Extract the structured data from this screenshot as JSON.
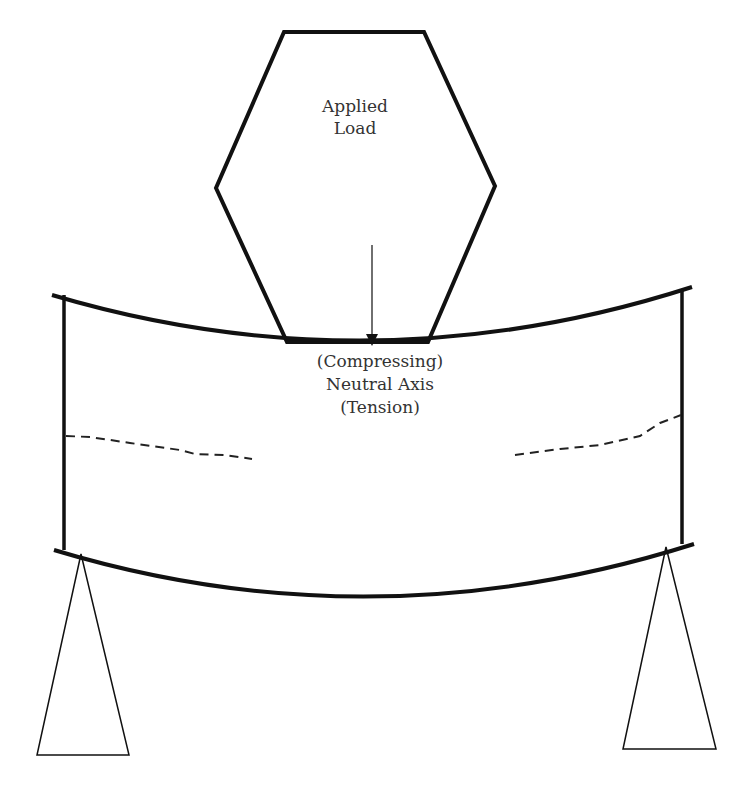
{
  "diagram": {
    "load_label": {
      "line1": "Applied",
      "line2": "Load"
    },
    "axis_labels": {
      "compressing": "(Compressing)",
      "neutral_axis": "Neutral Axis",
      "tension": "(Tension)"
    },
    "elements": [
      "applied-load-hexagon",
      "load-arrow",
      "curved-beam",
      "neutral-axis-dashed-lines",
      "left-support",
      "right-support"
    ],
    "colors": {
      "stroke": "#111111",
      "text": "#333333",
      "background": "#ffffff"
    }
  }
}
